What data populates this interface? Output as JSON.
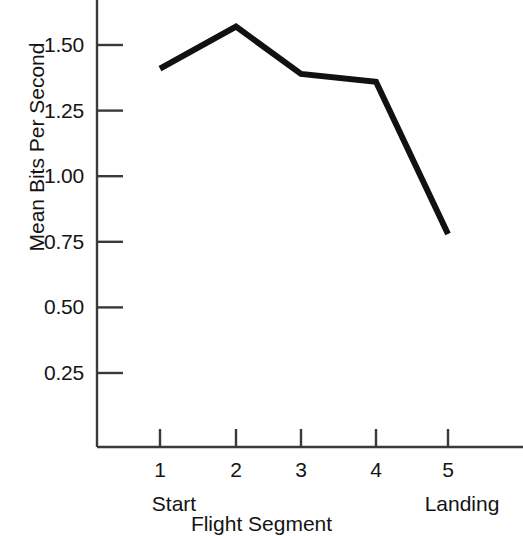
{
  "chart_data": {
    "type": "line",
    "title": "",
    "xlabel": "Flight Segment",
    "ylabel": "Mean Bits Per Second",
    "x": [
      1,
      2,
      3,
      4,
      5
    ],
    "values": [
      1.41,
      1.57,
      1.39,
      1.36,
      0.78
    ],
    "series": [
      {
        "name": "Mean Bits Per Second",
        "values": [
          1.41,
          1.57,
          1.39,
          1.36,
          0.78
        ]
      }
    ],
    "xtick_labels": [
      "1",
      "2",
      "3",
      "4",
      "5"
    ],
    "ytick_labels": [
      "1.50",
      "1.25",
      "1.00",
      "0.75",
      "0.50",
      "0.25"
    ],
    "ytick_values": [
      1.5,
      1.25,
      1.0,
      0.75,
      0.5,
      0.25
    ],
    "xlim": [
      0.45,
      5.6
    ],
    "ylim": [
      0.0,
      1.72
    ],
    "grid": false,
    "legend": "none",
    "category_annotations": [
      {
        "label": "Start",
        "x": 1
      },
      {
        "label": "Landing",
        "x": 5
      }
    ],
    "colors": {
      "line": "#111111",
      "axis": "#3a3a3a",
      "background": "#ffffff",
      "text": "#141414"
    },
    "line_width_px": 6
  }
}
